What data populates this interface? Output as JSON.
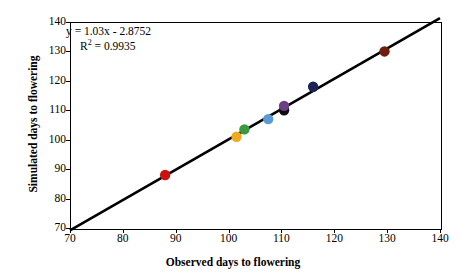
{
  "chart_data": {
    "type": "scatter",
    "title": "",
    "xlabel": "Observed days to flowering",
    "ylabel": "Simulated days to flowering",
    "xlim": [
      70,
      140
    ],
    "ylim": [
      70,
      140
    ],
    "xticks": [
      70,
      80,
      90,
      100,
      110,
      120,
      130,
      140
    ],
    "yticks": [
      70,
      80,
      90,
      100,
      110,
      120,
      130,
      140
    ],
    "grid": false,
    "legend": null,
    "annotations": {
      "equation": "y = 1.03x - 2.8752",
      "r_squared_label": "R",
      "r_squared_sup": "2",
      "r_squared_value": "= 0.9935"
    },
    "trendline": {
      "type": "linear",
      "slope": 1.03,
      "intercept": -2.8752,
      "x_start": 70,
      "y_start": 69.2,
      "x_end": 140,
      "y_end": 141.3,
      "color": "#000000"
    },
    "points": [
      {
        "label": "point-1",
        "x": 88.0,
        "y": 88.0,
        "color": "#cc1111"
      },
      {
        "label": "point-2",
        "x": 101.5,
        "y": 101.0,
        "color": "#edab22"
      },
      {
        "label": "point-3",
        "x": 103.0,
        "y": 103.5,
        "color": "#3a9a3d"
      },
      {
        "label": "point-4",
        "x": 107.5,
        "y": 107.0,
        "color": "#5b9bd5"
      },
      {
        "label": "point-5",
        "x": 110.5,
        "y": 110.0,
        "color": "#0d0d0d"
      },
      {
        "label": "point-6",
        "x": 110.5,
        "y": 111.5,
        "color": "#6b3f86"
      },
      {
        "label": "point-7",
        "x": 116.0,
        "y": 118.0,
        "color": "#1b2257"
      },
      {
        "label": "point-8",
        "x": 129.5,
        "y": 130.0,
        "color": "#6b1f0c"
      }
    ]
  }
}
